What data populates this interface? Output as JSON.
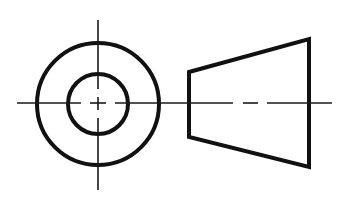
{
  "diagram": {
    "type": "orthographic-projection",
    "views": [
      {
        "name": "end-view",
        "center": [
          98,
          104
        ],
        "outer_circle_radius": 61,
        "inner_circle_radius": 30,
        "vertical_centerline": {
          "x": 98,
          "y1": 20,
          "y2": 190
        },
        "horizontal_centerline": {
          "y": 103,
          "x1": 17,
          "x2": 186
        }
      },
      {
        "name": "side-view",
        "shape": "trapezoid",
        "points": [
          [
            189,
            72
          ],
          [
            309,
            39
          ],
          [
            309,
            167
          ],
          [
            189,
            137
          ]
        ],
        "centerline": {
          "y": 103,
          "x1": 186,
          "x2": 332
        }
      }
    ],
    "colors": {
      "line": "#111111",
      "background": "#ffffff"
    }
  }
}
